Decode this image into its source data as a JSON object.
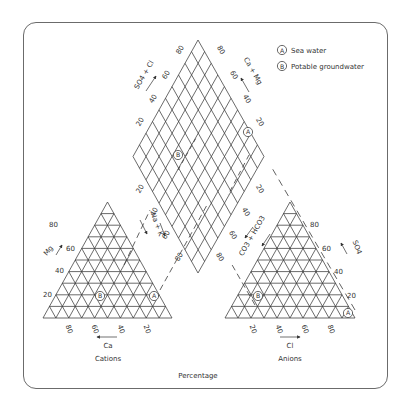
{
  "legend": {
    "items": [
      {
        "marker": "A",
        "label": "Sea water"
      },
      {
        "marker": "B",
        "label": "Potable groundwater"
      }
    ]
  },
  "cation_triangle": {
    "title": "Cations",
    "bottom_axis": {
      "label": "Ca",
      "ticks": [
        "80",
        "60",
        "40",
        "20"
      ],
      "arrow": "left"
    },
    "left_axis": {
      "label": "Mg",
      "ticks": [
        "20",
        "40",
        "60",
        "80"
      ],
      "arrow": "up-right"
    },
    "points": [
      {
        "marker": "A",
        "Ca_pct": 0,
        "Mg_pct": 20
      },
      {
        "marker": "B",
        "Ca_pct": 60,
        "Mg_pct": 20
      }
    ]
  },
  "anion_triangle": {
    "title": "Anions",
    "bottom_axis": {
      "label": "Cl",
      "ticks": [
        "20",
        "40",
        "60",
        "80"
      ],
      "arrow": "right"
    },
    "right_axis": {
      "label": "SO4",
      "ticks": [
        "20",
        "40",
        "60",
        "80"
      ],
      "arrow": "up-left"
    },
    "left_axis": {
      "label": "CO3 + HCO3",
      "arrow": "down-left"
    },
    "points": [
      {
        "marker": "A",
        "Cl_pct": 90,
        "SO4_pct": 10
      },
      {
        "marker": "B",
        "Cl_pct": 10,
        "SO4_pct": 20
      }
    ]
  },
  "diamond": {
    "upper_left_axis": {
      "label": "SO4 + Cl",
      "ticks": [
        "20",
        "40",
        "60",
        "80"
      ]
    },
    "upper_right_axis": {
      "label": "Ca + Mg",
      "ticks": [
        "20",
        "40",
        "60",
        "80"
      ]
    },
    "lower_left_axis": {
      "label": "Na + K",
      "ticks": [
        "20",
        "40",
        "60",
        "80"
      ]
    },
    "lower_right_axis": {
      "label": "CO3 + HCO3",
      "ticks": [
        "20",
        "40",
        "60",
        "80"
      ]
    },
    "points": [
      {
        "marker": "A"
      },
      {
        "marker": "B"
      }
    ]
  },
  "footer": {
    "label": "Percentage"
  },
  "colors": {
    "line": "#3a3a3a",
    "frame": "#6b6b6b",
    "text": "#333333"
  }
}
